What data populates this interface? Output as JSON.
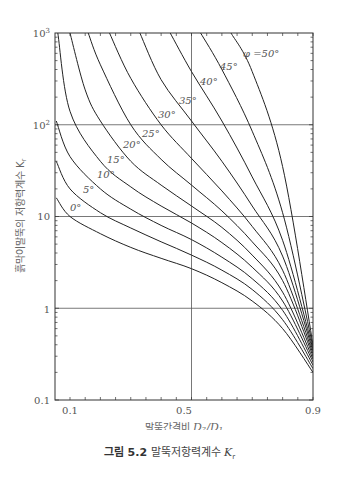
{
  "chart_data": {
    "type": "line",
    "title": "",
    "xlabel": "말뚝간격비 D2/D1",
    "ylabel": "흙막이말뚝의 저항력계수 Kr",
    "xscale": "linear",
    "yscale": "log",
    "xlim": [
      0.05,
      0.9
    ],
    "ylim": [
      0.1,
      1000
    ],
    "x_ticks": [
      "0.1",
      "0.5",
      "0.9"
    ],
    "y_ticks": [
      "0.1",
      "1",
      "10",
      "10²",
      "10³"
    ],
    "grid": true,
    "series": [
      {
        "name": "0°",
        "label": "0°",
        "points": [
          [
            0.055,
            16
          ],
          [
            0.1,
            10
          ],
          [
            0.2,
            6.5
          ],
          [
            0.3,
            4.6
          ],
          [
            0.4,
            3.5
          ],
          [
            0.5,
            2.7
          ],
          [
            0.6,
            1.9
          ],
          [
            0.7,
            1.2
          ],
          [
            0.8,
            0.6
          ],
          [
            0.9,
            0.2
          ]
        ]
      },
      {
        "name": "5°",
        "label": "5°",
        "points": [
          [
            0.055,
            40
          ],
          [
            0.1,
            20
          ],
          [
            0.2,
            11
          ],
          [
            0.3,
            7.5
          ],
          [
            0.4,
            5.3
          ],
          [
            0.5,
            3.8
          ],
          [
            0.6,
            2.6
          ],
          [
            0.7,
            1.6
          ],
          [
            0.8,
            0.75
          ],
          [
            0.9,
            0.22
          ]
        ]
      },
      {
        "name": "10°",
        "label": "10°",
        "points": [
          [
            0.055,
            110
          ],
          [
            0.1,
            45
          ],
          [
            0.2,
            20
          ],
          [
            0.3,
            12
          ],
          [
            0.4,
            8
          ],
          [
            0.5,
            5.6
          ],
          [
            0.6,
            3.6
          ],
          [
            0.7,
            2.1
          ],
          [
            0.8,
            0.95
          ],
          [
            0.9,
            0.24
          ]
        ]
      },
      {
        "name": "15°",
        "label": "15°",
        "points": [
          [
            0.06,
            1000
          ],
          [
            0.1,
            140
          ],
          [
            0.2,
            40
          ],
          [
            0.3,
            21
          ],
          [
            0.4,
            13
          ],
          [
            0.5,
            8.5
          ],
          [
            0.6,
            5.2
          ],
          [
            0.7,
            2.8
          ],
          [
            0.8,
            1.2
          ],
          [
            0.9,
            0.26
          ]
        ]
      },
      {
        "name": "20°",
        "label": "20°",
        "points": [
          [
            0.1,
            1000
          ],
          [
            0.15,
            240
          ],
          [
            0.2,
            110
          ],
          [
            0.3,
            40
          ],
          [
            0.4,
            22
          ],
          [
            0.5,
            13
          ],
          [
            0.6,
            7.6
          ],
          [
            0.7,
            3.8
          ],
          [
            0.8,
            1.5
          ],
          [
            0.9,
            0.28
          ]
        ]
      },
      {
        "name": "25°",
        "label": "25°",
        "points": [
          [
            0.16,
            1000
          ],
          [
            0.2,
            450
          ],
          [
            0.3,
            100
          ],
          [
            0.4,
            42
          ],
          [
            0.5,
            22
          ],
          [
            0.6,
            11.5
          ],
          [
            0.7,
            5.3
          ],
          [
            0.8,
            2
          ],
          [
            0.9,
            0.3
          ]
        ]
      },
      {
        "name": "30°",
        "label": "30°",
        "points": [
          [
            0.23,
            1000
          ],
          [
            0.3,
            320
          ],
          [
            0.4,
            100
          ],
          [
            0.5,
            43
          ],
          [
            0.6,
            19
          ],
          [
            0.7,
            7.8
          ],
          [
            0.8,
            2.6
          ],
          [
            0.9,
            0.32
          ]
        ]
      },
      {
        "name": "35°",
        "label": "35°",
        "points": [
          [
            0.33,
            1000
          ],
          [
            0.4,
            310
          ],
          [
            0.5,
            110
          ],
          [
            0.6,
            40
          ],
          [
            0.7,
            13
          ],
          [
            0.8,
            3.7
          ],
          [
            0.9,
            0.34
          ]
        ]
      },
      {
        "name": "40°",
        "label": "40°",
        "points": [
          [
            0.43,
            1000
          ],
          [
            0.5,
            380
          ],
          [
            0.6,
            110
          ],
          [
            0.7,
            27
          ],
          [
            0.8,
            5.5
          ],
          [
            0.9,
            0.36
          ]
        ]
      },
      {
        "name": "45°",
        "label": "45°",
        "points": [
          [
            0.53,
            1000
          ],
          [
            0.6,
            400
          ],
          [
            0.7,
            85
          ],
          [
            0.8,
            11
          ],
          [
            0.9,
            0.38
          ]
        ]
      },
      {
        "name": "50°",
        "label": "φ =50°",
        "points": [
          [
            0.63,
            1000
          ],
          [
            0.7,
            380
          ],
          [
            0.8,
            35
          ],
          [
            0.9,
            0.4
          ]
        ]
      }
    ],
    "gridlines": {
      "x": [
        0.5
      ],
      "y": [
        1,
        10,
        100
      ]
    }
  },
  "axis": {
    "y_ticks": [
      "0.1",
      "1",
      "10",
      "10",
      "10"
    ],
    "y_tick_exp": [
      "",
      "",
      "",
      "2",
      "3"
    ],
    "x_ticks": [
      "0.1",
      "0.5",
      "0.9"
    ]
  },
  "labels": {
    "ylabel": "흙막이말뚝의 저항력계수 K",
    "ylabel_sub": "r",
    "xlabel": "말뚝간격비 ",
    "xlabel_math": "D₂/D₁"
  },
  "caption": {
    "figure_no": "그림 5.2",
    "text": " 말뚝저항력계수 ",
    "symbol": "K",
    "symbol_sub": "r"
  }
}
